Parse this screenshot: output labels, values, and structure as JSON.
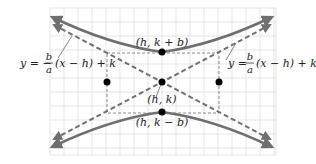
{
  "diagram": {
    "type": "hyperbola-vertical",
    "colors": {
      "grid": "#dcdcdc",
      "curve": "#6f6f6f",
      "asymptote": "#707070",
      "rectangle": "#8a8a8a",
      "point": "#000000",
      "text": "#222222"
    },
    "points": {
      "center": {
        "label": "(h, k)"
      },
      "top_vertex": {
        "label": "(h, k + b)"
      },
      "bottom_vertex": {
        "label": "(h, k − b)"
      }
    },
    "asymptotes": {
      "negative": {
        "lhs": "y = −",
        "num": "b",
        "den": "a",
        "rhs": "(x − h) + k"
      },
      "positive": {
        "lhs": "y =",
        "num": "b",
        "den": "a",
        "rhs": "(x − h) + k"
      }
    }
  }
}
